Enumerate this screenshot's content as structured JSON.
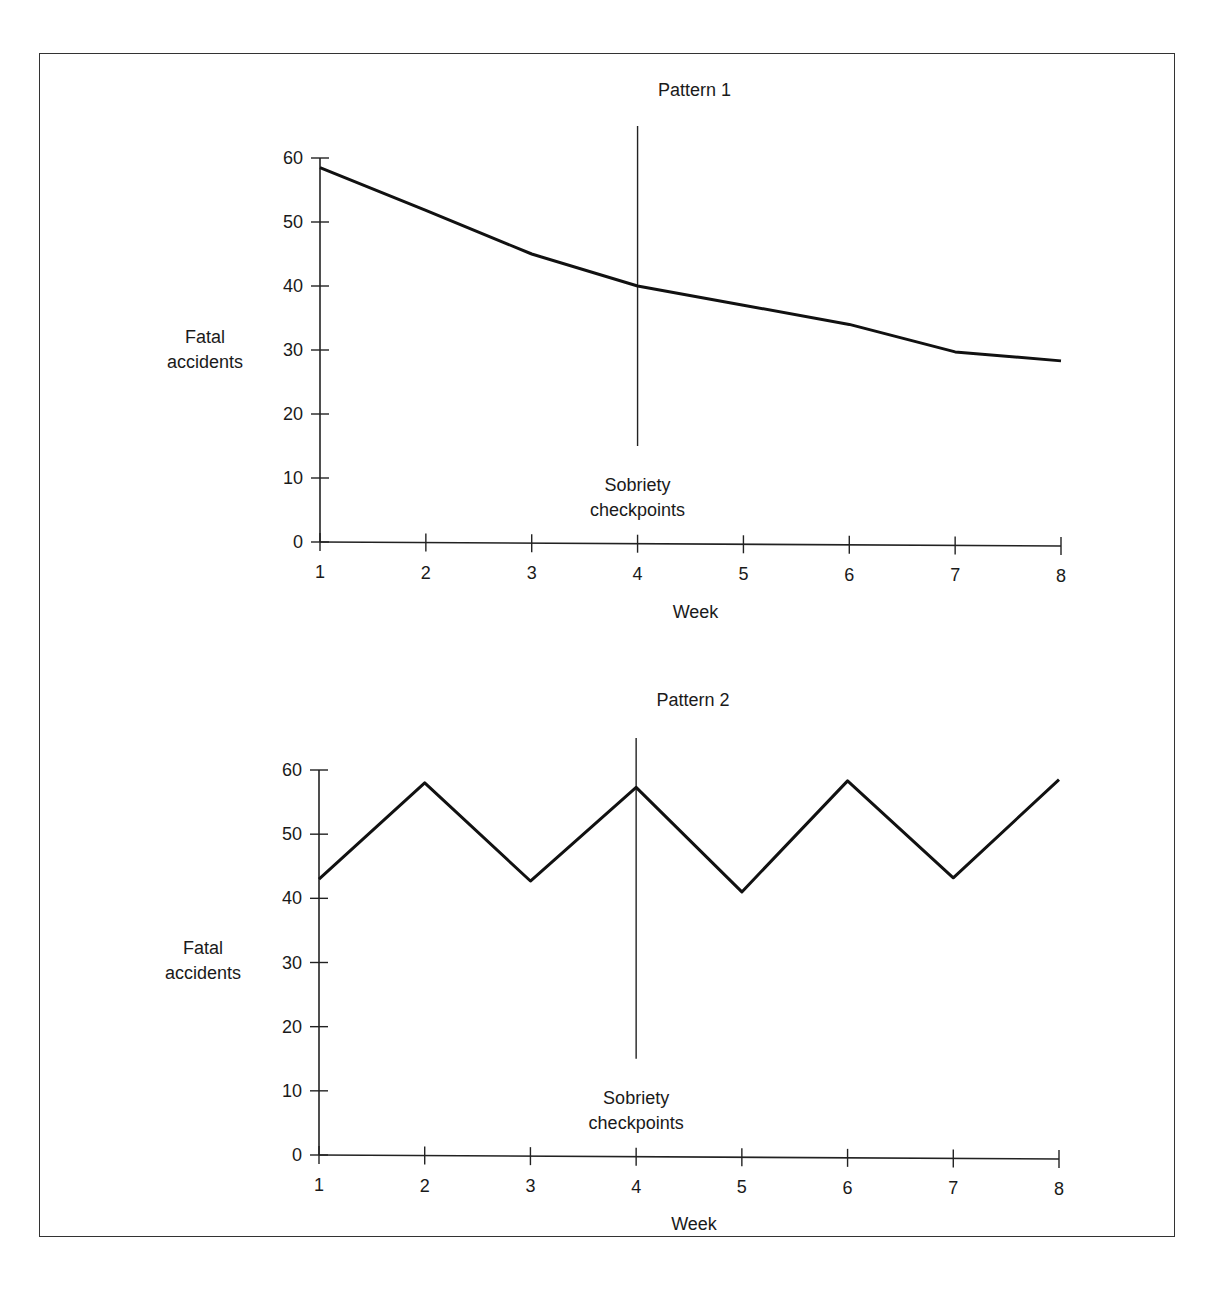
{
  "chart_data": [
    {
      "type": "line",
      "title": "Pattern 1",
      "xlabel": "Week",
      "ylabel": "Fatal accidents",
      "ylabel_lines": [
        "Fatal",
        "accidents"
      ],
      "x": [
        1,
        2,
        3,
        4,
        5,
        6,
        7,
        8
      ],
      "values": [
        58.5,
        51.8,
        45,
        40,
        37,
        34,
        29.7,
        28.3
      ],
      "yticks": [
        0,
        10,
        20,
        30,
        40,
        50,
        60
      ],
      "xticks": [
        1,
        2,
        3,
        4,
        5,
        6,
        7,
        8
      ],
      "ylim": [
        0,
        60
      ],
      "grid": false,
      "annotation": {
        "x": 4,
        "label_lines": [
          "Sobriety",
          "checkpoints"
        ],
        "line_from": 15,
        "line_to": 65
      }
    },
    {
      "type": "line",
      "title": "Pattern 2",
      "xlabel": "Week",
      "ylabel": "Fatal accidents",
      "ylabel_lines": [
        "Fatal",
        "accidents"
      ],
      "x": [
        1,
        2,
        3,
        4,
        5,
        6,
        7,
        8
      ],
      "values": [
        43,
        58,
        42.7,
        57.3,
        41,
        58.3,
        43.2,
        58.5
      ],
      "yticks": [
        0,
        10,
        20,
        30,
        40,
        50,
        60
      ],
      "xticks": [
        1,
        2,
        3,
        4,
        5,
        6,
        7,
        8
      ],
      "ylim": [
        0,
        60
      ],
      "grid": false,
      "annotation": {
        "x": 4,
        "label_lines": [
          "Sobriety",
          "checkpoints"
        ],
        "line_from": 15,
        "line_to": 65
      }
    }
  ]
}
